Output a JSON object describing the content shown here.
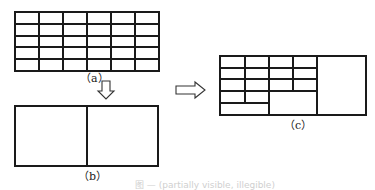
{
  "figure": {
    "caption": "图 — (partially visible, illegible)",
    "panels": [
      {
        "id": "a",
        "label": "（a）",
        "description": "Uniform grid",
        "rows": 5,
        "cols": 6
      },
      {
        "id": "b",
        "label": "（b）",
        "description": "Two equal halves",
        "rows": 1,
        "cols": 2
      },
      {
        "id": "c",
        "label": "（c）",
        "description": "Mixed-resolution grid: fine cells in the upper-left, merged cells lower-left and a large right block"
      }
    ],
    "arrows": [
      {
        "from": "a",
        "to": "b",
        "direction": "down"
      },
      {
        "from": "b",
        "to": "c",
        "direction": "right"
      }
    ],
    "line_color": "#1a1a1a",
    "background": "#ffffff"
  }
}
